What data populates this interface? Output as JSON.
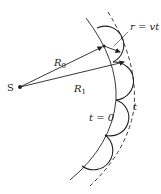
{
  "diagram": {
    "source_label": "S",
    "radius_labels": [
      "R",
      "R"
    ],
    "radius_subscripts": [
      "0",
      "1"
    ],
    "wavelet_radius_label": "r = vt",
    "initial_front_label": "t = 0",
    "later_front_label": "t",
    "colors": {
      "line": "#222222",
      "background": "#ffffff"
    }
  }
}
